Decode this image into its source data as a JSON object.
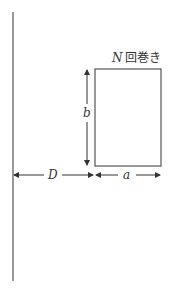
{
  "diagram": {
    "title": "",
    "colors": {
      "line": "#555555",
      "text": "#333333",
      "background": "#ffffff"
    },
    "wire": {
      "description": "long straight wire",
      "x": 13,
      "y_top": 12,
      "y_bottom": 281
    },
    "coil": {
      "label_var": "N",
      "label_suffix": "回巻き",
      "x": 95,
      "y": 69,
      "width": 66,
      "height": 97
    },
    "dimensions": {
      "b": {
        "label": "b",
        "x": 87,
        "y_top": 69,
        "y_bottom": 166,
        "label_y": 113
      },
      "D": {
        "label": "D",
        "y": 175,
        "x_start": 13,
        "x_end": 95,
        "label_x": 53
      },
      "a": {
        "label": "a",
        "y": 175,
        "x_start": 95,
        "x_end": 161,
        "label_x": 124
      }
    }
  }
}
